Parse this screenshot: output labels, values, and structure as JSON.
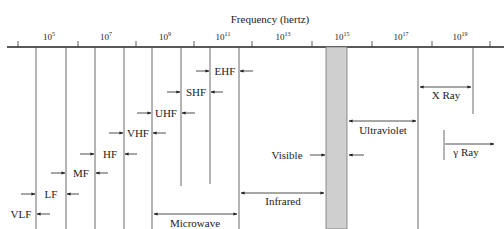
{
  "title": "Frequency (hertz)",
  "axis": {
    "tick_labels": [
      {
        "base": "10",
        "exp": "5",
        "x": 49
      },
      {
        "base": "10",
        "exp": "7",
        "x": 106
      },
      {
        "base": "10",
        "exp": "9",
        "x": 165
      },
      {
        "base": "10",
        "exp": "11",
        "x": 223
      },
      {
        "base": "10",
        "exp": "13",
        "x": 283
      },
      {
        "base": "10",
        "exp": "15",
        "x": 342
      },
      {
        "base": "10",
        "exp": "17",
        "x": 401
      },
      {
        "base": "10",
        "exp": "19",
        "x": 460
      }
    ]
  },
  "bands": {
    "vlf": "VLF",
    "lf": "LF",
    "mf": "MF",
    "hf": "HF",
    "vhf": "VHF",
    "uhf": "UHF",
    "shf": "SHF",
    "ehf": "EHF",
    "microwave": "Microwave",
    "infrared": "Infrared",
    "visible": "Visible",
    "ultraviolet": "Ultraviolet",
    "xray": "X Ray",
    "gamma": "γ Ray"
  },
  "colors": {
    "line": "#333333",
    "visible_fill": "#cfcfcf",
    "visible_stroke": "#777777"
  }
}
